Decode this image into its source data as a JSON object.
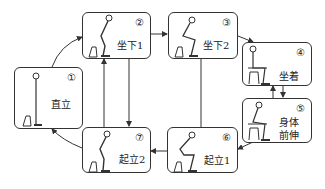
{
  "diagram": {
    "states": [
      {
        "id": 1,
        "num": "①",
        "label": "直立"
      },
      {
        "id": 2,
        "num": "②",
        "label": "坐下1"
      },
      {
        "id": 3,
        "num": "③",
        "label": "坐下2"
      },
      {
        "id": 4,
        "num": "④",
        "label": "坐着"
      },
      {
        "id": 5,
        "num": "⑤",
        "label_line1": "身体",
        "label_line2": "前伸"
      },
      {
        "id": 6,
        "num": "⑥",
        "label": "起立1"
      },
      {
        "id": 7,
        "num": "⑦",
        "label": "起立2"
      }
    ],
    "transitions": [
      {
        "from": 1,
        "to": 2
      },
      {
        "from": 2,
        "to": 3
      },
      {
        "from": 3,
        "to": 4
      },
      {
        "from": 4,
        "to": 5
      },
      {
        "from": 5,
        "to": 4
      },
      {
        "from": 5,
        "to": 6
      },
      {
        "from": 6,
        "to": 7
      },
      {
        "from": 7,
        "to": 1
      },
      {
        "from": 2,
        "to": 7
      },
      {
        "from": 7,
        "to": 2
      },
      {
        "from": 3,
        "to": 6
      }
    ],
    "colors": {
      "stroke": "#333333",
      "background": "#ffffff"
    }
  }
}
